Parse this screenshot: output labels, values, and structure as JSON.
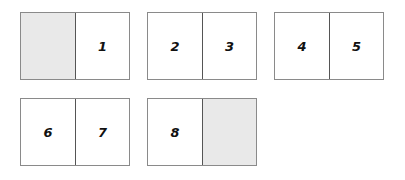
{
  "diagram": {
    "spreads": [
      {
        "left": "",
        "right": "1",
        "left_blank": true,
        "right_blank": false
      },
      {
        "left": "2",
        "right": "3"
      },
      {
        "left": "4",
        "right": "5"
      },
      {
        "left": "6",
        "right": "7"
      },
      {
        "left": "8",
        "right": "",
        "left_blank": false,
        "right_blank": true
      }
    ],
    "colors": {
      "blank_page": "#e9e9e9",
      "border": "#8a8a8a"
    }
  }
}
